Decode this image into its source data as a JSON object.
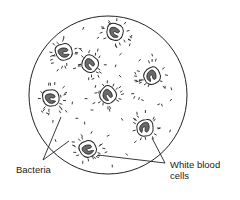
{
  "diagram": {
    "title": "",
    "field_of_view": {
      "cx": 108,
      "cy": 95,
      "r": 79,
      "stroke": "#222222"
    },
    "labels": {
      "bacteria": "Bacteria",
      "white_blood_cells_line1": "White blood",
      "white_blood_cells_line2": "cells"
    },
    "colors": {
      "ink": "#222222",
      "nucleus_fill": "#6b6b6b",
      "background": "#ffffff"
    },
    "white_blood_cells": [
      {
        "x": 115,
        "y": 32,
        "rot": 10
      },
      {
        "x": 64,
        "y": 52,
        "rot": -20
      },
      {
        "x": 90,
        "y": 64,
        "rot": 30
      },
      {
        "x": 152,
        "y": 76,
        "rot": 60
      },
      {
        "x": 108,
        "y": 95,
        "rot": 40
      },
      {
        "x": 51,
        "y": 98,
        "rot": -10
      },
      {
        "x": 145,
        "y": 128,
        "rot": 80
      },
      {
        "x": 88,
        "y": 149,
        "rot": -30
      }
    ],
    "leader_lines": {
      "bacteria": [
        {
          "x1": 43,
          "y1": 160,
          "x2": 61,
          "y2": 117
        },
        {
          "x1": 43,
          "y1": 160,
          "x2": 69,
          "y2": 141
        }
      ],
      "white_blood_cells": [
        {
          "x1": 165,
          "y1": 163,
          "x2": 98,
          "y2": 155
        },
        {
          "x1": 165,
          "y1": 163,
          "x2": 152,
          "y2": 138
        }
      ]
    }
  }
}
